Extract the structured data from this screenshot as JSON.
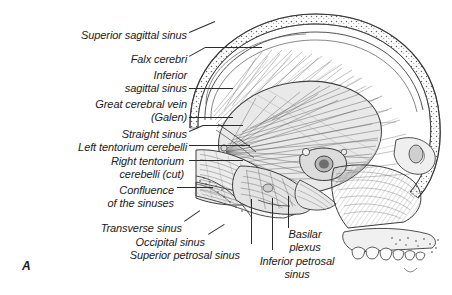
{
  "figure": {
    "letter": "A",
    "background_color": "#ffffff",
    "ink_color": "#2b2b2b"
  },
  "labels": [
    {
      "id": "superior-sagittal-sinus",
      "lines": [
        "Superior sagittal sinus"
      ],
      "x": 187,
      "y": 29,
      "align": "right"
    },
    {
      "id": "falx-cerebri",
      "lines": [
        "Falx cerebri"
      ],
      "x": 187,
      "y": 53,
      "align": "right"
    },
    {
      "id": "inferior-sagittal-sinus",
      "lines": [
        "Inferior",
        "sagittal sinus"
      ],
      "x": 187,
      "y": 69,
      "align": "right"
    },
    {
      "id": "great-cerebral-vein-galen",
      "lines": [
        "Great cerebral vein",
        "(Galen)"
      ],
      "x": 187,
      "y": 98,
      "align": "right"
    },
    {
      "id": "straight-sinus",
      "lines": [
        "Straight sinus"
      ],
      "x": 187,
      "y": 128,
      "align": "right"
    },
    {
      "id": "left-tentorium-cerebelli",
      "lines": [
        "Left tentorium cerebelli"
      ],
      "x": 187,
      "y": 141,
      "align": "right"
    },
    {
      "id": "right-tentorium-cerebelli-cut",
      "lines": [
        "Right tentorium",
        "cerebelli (cut)"
      ],
      "x": 184,
      "y": 155,
      "align": "right"
    },
    {
      "id": "confluence-of-the-sinuses",
      "lines": [
        "Confluence",
        "of the sinuses"
      ],
      "x": 174,
      "y": 184,
      "align": "right"
    },
    {
      "id": "transverse-sinus",
      "lines": [
        "Transverse sinus"
      ],
      "x": 182,
      "y": 222,
      "align": "right"
    },
    {
      "id": "occipital-sinus",
      "lines": [
        "Occipital sinus"
      ],
      "x": 205,
      "y": 236,
      "align": "right"
    },
    {
      "id": "superior-petrosal-sinus",
      "lines": [
        "Superior petrosal sinus"
      ],
      "x": 240,
      "y": 249,
      "align": "right"
    },
    {
      "id": "basilar-plexus",
      "lines": [
        "Basilar",
        "plexus"
      ],
      "x": 305,
      "y": 228,
      "align": "center"
    },
    {
      "id": "inferior-petrosal-sinus",
      "lines": [
        "Inferior petrosal",
        "sinus"
      ],
      "x": 297,
      "y": 255,
      "align": "center"
    }
  ],
  "leaders": [
    {
      "id": "leader-superior-sagittal-sinus",
      "type": "diagonal",
      "x1": 189,
      "y1": 32,
      "x2": 215,
      "y2": 21
    },
    {
      "id": "leader-falx-cerebri",
      "type": "diagonal",
      "x1": 189,
      "y1": 56,
      "x2": 205,
      "y2": 47
    },
    {
      "id": "leader-falx-cerebri-run",
      "type": "horizontal",
      "x1": 205,
      "y1": 47,
      "x2": 262,
      "y2": 47
    },
    {
      "id": "leader-inferior-sagittal-sinus",
      "type": "horizontal",
      "x1": 189,
      "y1": 88,
      "x2": 233,
      "y2": 88
    },
    {
      "id": "leader-great-cerebral-vein",
      "type": "horizontal",
      "x1": 189,
      "y1": 117,
      "x2": 233,
      "y2": 117
    },
    {
      "id": "leader-straight-sinus",
      "type": "diagonal",
      "x1": 189,
      "y1": 131,
      "x2": 203,
      "y2": 125
    },
    {
      "id": "leader-straight-sinus-run",
      "type": "horizontal",
      "x1": 203,
      "y1": 125,
      "x2": 243,
      "y2": 125
    },
    {
      "id": "leader-left-tentorium",
      "type": "horizontal",
      "x1": 189,
      "y1": 145,
      "x2": 250,
      "y2": 145
    },
    {
      "id": "leader-right-tentorium",
      "type": "horizontal",
      "x1": 189,
      "y1": 160,
      "x2": 243,
      "y2": 160
    },
    {
      "id": "leader-confluence",
      "type": "horizontal",
      "x1": 177,
      "y1": 187,
      "x2": 213,
      "y2": 187
    },
    {
      "id": "leader-transverse-sinus",
      "type": "diagonal",
      "x1": 184,
      "y1": 221,
      "x2": 200,
      "y2": 210
    },
    {
      "id": "leader-occipital-sinus",
      "type": "diagonal",
      "x1": 208,
      "y1": 234,
      "x2": 224,
      "y2": 224
    },
    {
      "id": "leader-superior-petrosal-sinus",
      "type": "vertical",
      "x1": 251,
      "y1": 199,
      "x2": 251,
      "y2": 244
    },
    {
      "id": "leader-basilar-plexus",
      "type": "vertical",
      "x1": 288,
      "y1": 196,
      "x2": 288,
      "y2": 228
    },
    {
      "id": "leader-inferior-petrosal-sinus",
      "type": "vertical",
      "x1": 272,
      "y1": 198,
      "x2": 272,
      "y2": 250
    }
  ]
}
